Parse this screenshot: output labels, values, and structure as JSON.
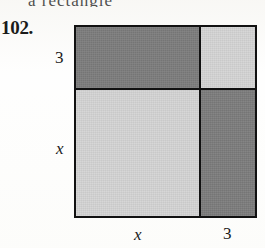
{
  "page": {
    "background_color": "#fdfdfc",
    "bleed_text": "a rectangle",
    "ink_color": "#1a1a1a"
  },
  "exercise": {
    "number_label": "102."
  },
  "figure": {
    "kind": "area-model-square",
    "outline_color": "#111111",
    "dark_fill": "#7d7d7d",
    "light_fill": "#d5d5d5",
    "row_labels": [
      "3",
      "x"
    ],
    "column_labels": [
      "x",
      "3"
    ],
    "cells": [
      {
        "name": "top-left",
        "shade": "dark",
        "row": "3",
        "column": "x"
      },
      {
        "name": "top-right",
        "shade": "light",
        "row": "3",
        "column": "3"
      },
      {
        "name": "bottom-left",
        "shade": "light",
        "row": "x",
        "column": "x"
      },
      {
        "name": "bottom-right",
        "shade": "dark",
        "row": "x",
        "column": "3"
      }
    ]
  },
  "labels": {
    "row_top": "3",
    "row_bottom": "x",
    "col_left": "x",
    "col_right": "3"
  }
}
